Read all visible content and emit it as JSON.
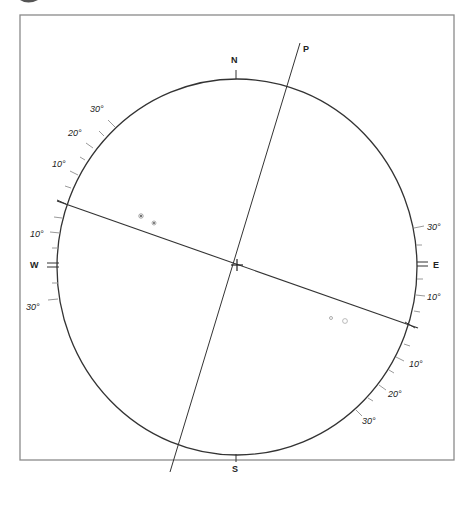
{
  "diagram": {
    "type": "stereographic-projection",
    "frame": {
      "x": 20,
      "y": 15,
      "w": 434,
      "h": 445,
      "stroke": "#8a8a8a"
    },
    "circle": {
      "cx": 237,
      "cy": 267,
      "rx": 180,
      "ry": 188,
      "stroke": "#333333"
    },
    "center_mark": {
      "x": 237,
      "y": 265
    },
    "cardinal_labels": {
      "north": "N",
      "south": "S",
      "west": "W",
      "east": "E",
      "pole": "P"
    },
    "degree_labels": {
      "nw_30": "30°",
      "nw_20": "20°",
      "nw_10": "10°",
      "w_10": "10°",
      "w_30": "30°",
      "e_30": "30°",
      "e_10": "10°",
      "se_10": "10°",
      "se_20": "20°",
      "se_30": "30°"
    },
    "great_circle_line": {
      "x1": 57,
      "y1": 201,
      "x2": 418,
      "y2": 328
    },
    "pole_line": {
      "x1": 300,
      "y1": 43,
      "x2": 170,
      "y2": 472
    },
    "points": [
      {
        "label": "e",
        "x": 141,
        "y": 216
      },
      {
        "label": "e",
        "x": 154,
        "y": 223
      },
      {
        "label": "e",
        "x": 331,
        "y": 318
      },
      {
        "label": "d",
        "x": 345,
        "y": 321
      }
    ],
    "colors": {
      "ink": "#333333",
      "faint": "#9a9a9a",
      "frame": "#8a8a8a"
    }
  }
}
